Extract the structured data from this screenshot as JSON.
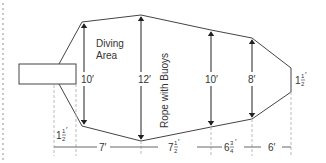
{
  "diagram": {
    "type": "pool-layout",
    "colors": {
      "line": "#444444",
      "dashed": "#bbbbbb",
      "text": "#333333",
      "left_dots": "#cccccc"
    },
    "labels": {
      "diving_area_line1": "Diving",
      "diving_area_line2": "Area",
      "rope": "Rope with Buoys"
    },
    "widths": {
      "w1": "10′",
      "w2": "12′",
      "w3": "10′",
      "w4": "8′",
      "right_end_whole": "1",
      "right_end_num": "1",
      "right_end_den": "2",
      "right_end_unit": "′"
    },
    "lengths": {
      "left_offset_whole": "1",
      "left_offset_num": "1",
      "left_offset_den": "2",
      "left_offset_unit": "′",
      "seg1": "7′",
      "seg2_whole": "7",
      "seg2_num": "1",
      "seg2_den": "2",
      "seg2_unit": "′",
      "seg3_whole": "6",
      "seg3_num": "3",
      "seg3_den": "4",
      "seg3_unit": "′",
      "seg4": "6′"
    }
  }
}
